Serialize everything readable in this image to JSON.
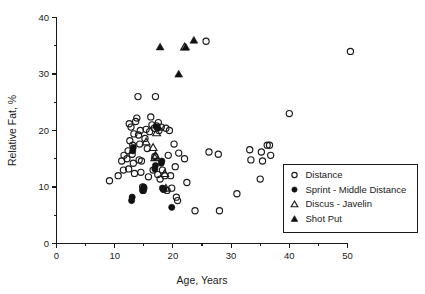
{
  "chart_data": {
    "type": "scatter",
    "title": "",
    "xlabel": "Age, Years",
    "ylabel": "Relative Fat, %",
    "xlim": [
      0,
      50
    ],
    "ylim": [
      0,
      40
    ],
    "xticks": [
      0,
      10,
      20,
      30,
      40,
      50
    ],
    "yticks": [
      0,
      10,
      20,
      30,
      40
    ],
    "xtick_labels": [
      "0",
      "10",
      "20",
      "30",
      "40",
      "50"
    ],
    "ytick_labels": [
      "0",
      "10",
      "20",
      "30",
      "40"
    ],
    "x_minor_ticks": [
      5,
      15,
      25,
      35,
      45
    ],
    "y_minor_ticks": [
      5,
      15,
      25,
      35
    ],
    "grid": false,
    "legend_position": "lower-right",
    "series": [
      {
        "name": "Distance",
        "marker": "open-circle",
        "color": "#1a1a1a",
        "points": [
          [
            9.1,
            11.1
          ],
          [
            10.6,
            12.0
          ],
          [
            11.2,
            14.6
          ],
          [
            11.5,
            13.0
          ],
          [
            11.6,
            15.6
          ],
          [
            12.1,
            15.0
          ],
          [
            12.3,
            16.4
          ],
          [
            12.4,
            13.2
          ],
          [
            12.5,
            21.2
          ],
          [
            12.6,
            18.2
          ],
          [
            12.8,
            20.6
          ],
          [
            13.0,
            15.8
          ],
          [
            13.1,
            17.4
          ],
          [
            13.2,
            14.2
          ],
          [
            13.3,
            19.4
          ],
          [
            13.4,
            12.4
          ],
          [
            13.6,
            21.6
          ],
          [
            13.8,
            22.2
          ],
          [
            14.0,
            26.0
          ],
          [
            14.1,
            19.2
          ],
          [
            14.2,
            14.8
          ],
          [
            14.3,
            17.6
          ],
          [
            14.4,
            20.0
          ],
          [
            14.5,
            12.6
          ],
          [
            14.6,
            14.6
          ],
          [
            14.8,
            10.0
          ],
          [
            14.9,
            9.4
          ],
          [
            15.0,
            9.8
          ],
          [
            15.2,
            18.6
          ],
          [
            15.4,
            20.2
          ],
          [
            15.6,
            16.8
          ],
          [
            15.8,
            11.8
          ],
          [
            16.0,
            19.8
          ],
          [
            16.2,
            22.4
          ],
          [
            16.4,
            21.0
          ],
          [
            16.6,
            13.0
          ],
          [
            16.8,
            20.4
          ],
          [
            16.9,
            15.4
          ],
          [
            17.0,
            26.0
          ],
          [
            17.2,
            20.8
          ],
          [
            17.4,
            12.2
          ],
          [
            17.5,
            21.4
          ],
          [
            17.6,
            20.0
          ],
          [
            17.8,
            11.4
          ],
          [
            18.0,
            20.6
          ],
          [
            18.2,
            13.0
          ],
          [
            18.4,
            9.6
          ],
          [
            18.6,
            12.0
          ],
          [
            18.8,
            20.4
          ],
          [
            19.0,
            9.4
          ],
          [
            19.2,
            15.6
          ],
          [
            19.4,
            20.0
          ],
          [
            19.6,
            12.0
          ],
          [
            19.8,
            9.8
          ],
          [
            20.2,
            17.6
          ],
          [
            20.4,
            13.6
          ],
          [
            20.6,
            8.2
          ],
          [
            20.8,
            7.6
          ],
          [
            21.0,
            16.0
          ],
          [
            22.0,
            15.0
          ],
          [
            22.4,
            10.8
          ],
          [
            23.8,
            5.8
          ],
          [
            25.7,
            35.8
          ],
          [
            26.2,
            16.2
          ],
          [
            27.8,
            15.8
          ],
          [
            28.0,
            5.8
          ],
          [
            31.0,
            8.8
          ],
          [
            33.2,
            16.6
          ],
          [
            33.4,
            14.8
          ],
          [
            35.0,
            11.4
          ],
          [
            35.2,
            16.2
          ],
          [
            35.4,
            14.6
          ],
          [
            36.2,
            17.4
          ],
          [
            36.6,
            17.4
          ],
          [
            36.8,
            15.6
          ],
          [
            40.0,
            23.0
          ],
          [
            50.5,
            34.0
          ]
        ]
      },
      {
        "name": "Sprint - Middle Distance",
        "marker": "filled-circle",
        "color": "#111111",
        "points": [
          [
            12.9,
            7.6
          ],
          [
            13.0,
            8.2
          ],
          [
            13.1,
            16.4
          ],
          [
            13.2,
            17.0
          ],
          [
            14.8,
            9.4
          ],
          [
            15.0,
            10.0
          ],
          [
            16.9,
            13.2
          ],
          [
            17.0,
            13.8
          ],
          [
            17.2,
            20.6
          ],
          [
            17.4,
            20.4
          ],
          [
            18.0,
            14.2
          ],
          [
            18.1,
            14.6
          ],
          [
            18.2,
            9.8
          ],
          [
            18.4,
            9.6
          ],
          [
            19.8,
            6.4
          ]
        ]
      },
      {
        "name": "Discus - Javelin",
        "marker": "open-triangle",
        "color": "#1a1a1a",
        "points": [
          [
            15.4,
            18.0
          ],
          [
            16.6,
            17.0
          ],
          [
            16.9,
            15.2
          ],
          [
            17.0,
            15.6
          ],
          [
            17.2,
            19.6
          ],
          [
            18.6,
            12.4
          ],
          [
            18.8,
            9.8
          ],
          [
            22.0,
            34.8
          ]
        ]
      },
      {
        "name": "Shot Put",
        "marker": "filled-triangle",
        "color": "#111111",
        "points": [
          [
            17.8,
            34.8
          ],
          [
            21.0,
            30.0
          ],
          [
            22.2,
            34.8
          ],
          [
            23.6,
            36.0
          ]
        ]
      }
    ]
  },
  "legend": {
    "entries": [
      {
        "label": "Distance",
        "marker": "open-circle"
      },
      {
        "label": "Sprint - Middle Distance",
        "marker": "filled-circle"
      },
      {
        "label": "Discus - Javelin",
        "marker": "open-triangle"
      },
      {
        "label": "Shot Put",
        "marker": "filled-triangle"
      }
    ]
  }
}
